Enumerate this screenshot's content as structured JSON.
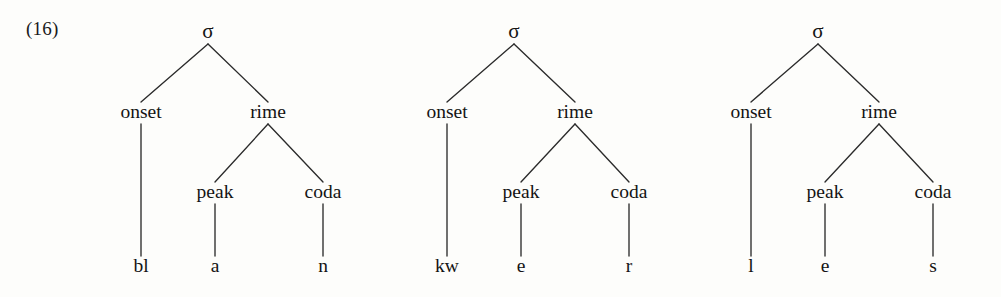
{
  "figure": {
    "example_number": "(16)",
    "ink_color": "#2b2b2b",
    "text_color": "#141414",
    "background_color": "#fdfdfb"
  },
  "trees": [
    {
      "name": "syllable-tree-blan",
      "root": {
        "label": "σ",
        "x": 208,
        "y": 38
      },
      "nodes": [
        {
          "name": "onset",
          "label": "onset",
          "x": 141,
          "y": 118
        },
        {
          "name": "rime",
          "label": "rime",
          "x": 268,
          "y": 118
        },
        {
          "name": "peak",
          "label": "peak",
          "x": 215,
          "y": 198
        },
        {
          "name": "coda",
          "label": "coda",
          "x": 323,
          "y": 198
        }
      ],
      "terminals": [
        {
          "name": "onset-segment",
          "label": "bl",
          "x": 141,
          "y": 272
        },
        {
          "name": "peak-segment",
          "label": "a",
          "x": 215,
          "y": 272
        },
        {
          "name": "coda-segment",
          "label": "n",
          "x": 323,
          "y": 272
        }
      ]
    },
    {
      "name": "syllable-tree-kwer",
      "root": {
        "label": "σ",
        "x": 514,
        "y": 38
      },
      "nodes": [
        {
          "name": "onset",
          "label": "onset",
          "x": 447,
          "y": 118
        },
        {
          "name": "rime",
          "label": "rime",
          "x": 575,
          "y": 118
        },
        {
          "name": "peak",
          "label": "peak",
          "x": 521,
          "y": 198
        },
        {
          "name": "coda",
          "label": "coda",
          "x": 629,
          "y": 198
        }
      ],
      "terminals": [
        {
          "name": "onset-segment",
          "label": "kw",
          "x": 447,
          "y": 272
        },
        {
          "name": "peak-segment",
          "label": "e",
          "x": 521,
          "y": 272
        },
        {
          "name": "coda-segment",
          "label": "r",
          "x": 629,
          "y": 272
        }
      ]
    },
    {
      "name": "syllable-tree-les",
      "root": {
        "label": "σ",
        "x": 818,
        "y": 38
      },
      "nodes": [
        {
          "name": "onset",
          "label": "onset",
          "x": 751,
          "y": 118
        },
        {
          "name": "rime",
          "label": "rime",
          "x": 879,
          "y": 118
        },
        {
          "name": "peak",
          "label": "peak",
          "x": 825,
          "y": 198
        },
        {
          "name": "coda",
          "label": "coda",
          "x": 933,
          "y": 198
        }
      ],
      "terminals": [
        {
          "name": "onset-segment",
          "label": "l",
          "x": 751,
          "y": 272
        },
        {
          "name": "peak-segment",
          "label": "e",
          "x": 825,
          "y": 272
        },
        {
          "name": "coda-segment",
          "label": "s",
          "x": 933,
          "y": 272
        }
      ]
    }
  ]
}
